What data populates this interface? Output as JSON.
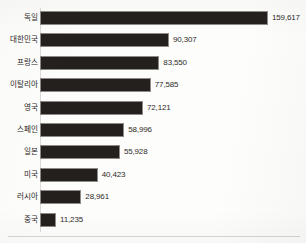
{
  "chart_data": {
    "type": "bar",
    "orientation": "horizontal",
    "title": "",
    "subtitle": "",
    "xlabel": "",
    "ylabel": "",
    "grid": false,
    "legend": false,
    "axis_ticks_visible": false,
    "value_labels_visible": true,
    "xlim": [
      0,
      170000
    ],
    "bar_color": "#24201e",
    "bar_border_color": "#8e8a86",
    "label_color": "#2a2724",
    "background_color": "#fdfdfc",
    "categories": [
      "독일",
      "대한민국",
      "프랑스",
      "이탈리아",
      "영국",
      "스페인",
      "일본",
      "미국",
      "러시아",
      "중국"
    ],
    "values": [
      159617,
      90307,
      83550,
      77585,
      72121,
      58996,
      55928,
      40423,
      28961,
      11235
    ],
    "value_labels": [
      "159,617",
      "90,307",
      "83,550",
      "77,585",
      "72,121",
      "58,996",
      "55,928",
      "40,423",
      "28,961",
      "11,235"
    ],
    "rows": [
      {
        "category": "독일",
        "value": 159617,
        "value_label": "159,617"
      },
      {
        "category": "대한민국",
        "value": 90307,
        "value_label": "90,307"
      },
      {
        "category": "프랑스",
        "value": 83550,
        "value_label": "83,550"
      },
      {
        "category": "이탈리아",
        "value": 77585,
        "value_label": "77,585"
      },
      {
        "category": "영국",
        "value": 72121,
        "value_label": "72,121"
      },
      {
        "category": "스페인",
        "value": 58996,
        "value_label": "58,996"
      },
      {
        "category": "일본",
        "value": 55928,
        "value_label": "55,928"
      },
      {
        "category": "미국",
        "value": 40423,
        "value_label": "40,423"
      },
      {
        "category": "러시아",
        "value": 28961,
        "value_label": "28,961"
      },
      {
        "category": "중국",
        "value": 11235,
        "value_label": "11,235"
      }
    ]
  },
  "layout": {
    "bar_origin_x": 40,
    "bar_height": 14,
    "row_pitch": 22.4,
    "first_row_top": 11,
    "max_bar_width": 228,
    "value_label_gap": 4
  }
}
